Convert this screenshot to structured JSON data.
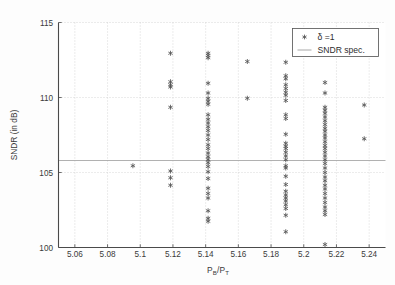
{
  "chart_data": {
    "type": "scatter",
    "title": "",
    "xlabel": "P_B/P_T",
    "xlabel_parts": {
      "main1": "P",
      "sub1": "B",
      "slash": "/",
      "main2": "P",
      "sub2": "T"
    },
    "ylabel": "SNDR (in dB)",
    "xlim": [
      5.05,
      5.25
    ],
    "ylim": [
      100,
      115
    ],
    "xticks": [
      5.06,
      5.08,
      5.1,
      5.12,
      5.14,
      5.16,
      5.18,
      5.2,
      5.22,
      5.24
    ],
    "xtick_labels": [
      "5.06",
      "5.08",
      "5.1",
      "5.12",
      "5.14",
      "5.16",
      "5.18",
      "5.2",
      "5.22",
      "5.24"
    ],
    "yticks": [
      100,
      105,
      110,
      115
    ],
    "ytick_labels": [
      "100",
      "105",
      "110",
      "115"
    ],
    "grid": true,
    "grid_style": "dotted",
    "legend_position": "top-right",
    "legend": [
      {
        "label": "δ =1",
        "marker": "star",
        "color": "#555555"
      },
      {
        "label": "SNDR spec.",
        "marker": "line",
        "color": "#a8a8a8"
      }
    ],
    "spec_line": {
      "name": "SNDR spec.",
      "y": 105.8,
      "color": "#a8a8a8"
    },
    "series": [
      {
        "name": "δ =1",
        "marker": "star",
        "color": "#555555",
        "points": [
          [
            5.0955,
            105.45
          ],
          [
            5.1185,
            112.95
          ],
          [
            5.1185,
            111.05
          ],
          [
            5.1185,
            110.85
          ],
          [
            5.1185,
            110.7
          ],
          [
            5.1185,
            109.35
          ],
          [
            5.1185,
            105.1
          ],
          [
            5.1185,
            104.65
          ],
          [
            5.1185,
            104.15
          ],
          [
            5.1415,
            112.95
          ],
          [
            5.1415,
            112.8
          ],
          [
            5.1415,
            112.65
          ],
          [
            5.1415,
            110.95
          ],
          [
            5.1415,
            110.3
          ],
          [
            5.1415,
            109.95
          ],
          [
            5.1415,
            109.75
          ],
          [
            5.1415,
            109.55
          ],
          [
            5.1415,
            108.85
          ],
          [
            5.1415,
            108.55
          ],
          [
            5.1415,
            108.3
          ],
          [
            5.1415,
            108.05
          ],
          [
            5.1415,
            107.8
          ],
          [
            5.1415,
            107.5
          ],
          [
            5.1415,
            107.2
          ],
          [
            5.1415,
            106.85
          ],
          [
            5.1415,
            106.6
          ],
          [
            5.1415,
            106.3
          ],
          [
            5.1415,
            106.05
          ],
          [
            5.1415,
            105.85
          ],
          [
            5.1415,
            105.65
          ],
          [
            5.1415,
            105.4
          ],
          [
            5.1415,
            105.05
          ],
          [
            5.1415,
            104.6
          ],
          [
            5.1415,
            103.95
          ],
          [
            5.1415,
            103.6
          ],
          [
            5.1415,
            103.3
          ],
          [
            5.1415,
            102.45
          ],
          [
            5.1415,
            101.95
          ],
          [
            5.1415,
            101.75
          ],
          [
            5.1655,
            112.4
          ],
          [
            5.1655,
            109.95
          ],
          [
            5.189,
            112.35
          ],
          [
            5.189,
            111.45
          ],
          [
            5.189,
            111.25
          ],
          [
            5.189,
            110.85
          ],
          [
            5.189,
            110.6
          ],
          [
            5.189,
            110.35
          ],
          [
            5.189,
            110.15
          ],
          [
            5.189,
            109.8
          ],
          [
            5.189,
            108.85
          ],
          [
            5.189,
            108.6
          ],
          [
            5.189,
            107.55
          ],
          [
            5.189,
            106.95
          ],
          [
            5.189,
            106.75
          ],
          [
            5.189,
            106.6
          ],
          [
            5.189,
            106.35
          ],
          [
            5.189,
            106.1
          ],
          [
            5.189,
            105.85
          ],
          [
            5.189,
            105.45
          ],
          [
            5.189,
            105.3
          ],
          [
            5.189,
            104.75
          ],
          [
            5.189,
            104.2
          ],
          [
            5.189,
            103.75
          ],
          [
            5.189,
            103.5
          ],
          [
            5.189,
            103.3
          ],
          [
            5.189,
            103.1
          ],
          [
            5.189,
            102.85
          ],
          [
            5.189,
            102.6
          ],
          [
            5.189,
            102.15
          ],
          [
            5.189,
            101.05
          ],
          [
            5.213,
            111.0
          ],
          [
            5.213,
            110.3
          ],
          [
            5.213,
            109.35
          ],
          [
            5.213,
            109.15
          ],
          [
            5.213,
            108.95
          ],
          [
            5.213,
            108.7
          ],
          [
            5.213,
            108.45
          ],
          [
            5.213,
            108.2
          ],
          [
            5.213,
            107.95
          ],
          [
            5.213,
            107.75
          ],
          [
            5.213,
            107.5
          ],
          [
            5.213,
            107.3
          ],
          [
            5.213,
            107.05
          ],
          [
            5.213,
            106.8
          ],
          [
            5.213,
            106.6
          ],
          [
            5.213,
            106.35
          ],
          [
            5.213,
            106.1
          ],
          [
            5.213,
            105.85
          ],
          [
            5.213,
            105.6
          ],
          [
            5.213,
            105.3
          ],
          [
            5.213,
            105.0
          ],
          [
            5.213,
            104.7
          ],
          [
            5.213,
            104.45
          ],
          [
            5.213,
            104.15
          ],
          [
            5.213,
            103.9
          ],
          [
            5.213,
            103.6
          ],
          [
            5.213,
            103.3
          ],
          [
            5.213,
            103.0
          ],
          [
            5.213,
            102.7
          ],
          [
            5.213,
            102.45
          ],
          [
            5.213,
            102.2
          ],
          [
            5.213,
            100.2
          ],
          [
            5.237,
            109.5
          ],
          [
            5.237,
            107.25
          ]
        ]
      }
    ]
  }
}
